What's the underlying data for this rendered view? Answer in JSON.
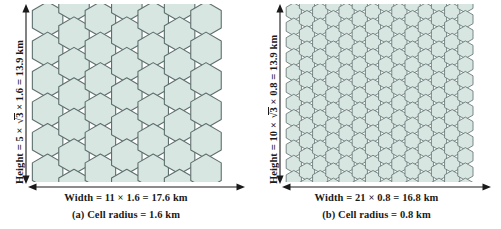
{
  "figure": {
    "background": "#ffffff",
    "cell_fill": "#d8e6e2",
    "cell_stroke": "#5d6f6d",
    "dim_color": "#1a1a1a"
  },
  "panel_a": {
    "height_label": {
      "prefix": "Height = 5 ",
      "times1": "×",
      "radical_body": "3",
      "times2": "×",
      "multiplier": "1.6",
      "equals": "= 13.9 km",
      "full_text": "Height = 5 × √3 × 1.6 = 13.9 km"
    },
    "width_label": "Width = 11 × 1.6 = 17.6 km",
    "subcaption": "(a)  Cell radius = 1.6 km",
    "grid": {
      "hex_radius_px": 17.6,
      "columns": 7,
      "rows_tall": 5,
      "rows_short": 5,
      "orientation": "pointy-top"
    },
    "values": {
      "cell_radius_km": 1.6,
      "height_cells": 5,
      "width_cells": 11,
      "height_km": 13.9,
      "width_km": 17.6
    }
  },
  "panel_b": {
    "height_label": {
      "prefix": "Height = 10 ",
      "times1": "×",
      "radical_body": "3",
      "times2": "×",
      "multiplier": "0.8",
      "equals": "= 13.9 km",
      "full_text": "Height = 10 × √3 × 0.8 = 13.9 km"
    },
    "width_label": "Width = 21 × 0.8 = 16.8 km",
    "subcaption": "(b)  Cell radius = 0.8 km",
    "grid": {
      "hex_radius_px": 8.8,
      "columns": 14,
      "rows_tall": 10,
      "rows_short": 10,
      "orientation": "pointy-top"
    },
    "values": {
      "cell_radius_km": 0.8,
      "height_cells": 10,
      "width_cells": 21,
      "height_km": 13.9,
      "width_km": 16.8
    }
  },
  "chart_data": {
    "type": "diagram",
    "panels": [
      {
        "id": "a",
        "cell_radius_km": 1.6,
        "height_km": 13.9,
        "width_km": 17.6,
        "height_expr": "5 × √3 × 1.6",
        "width_expr": "11 × 1.6",
        "caption": "(a)  Cell radius = 1.6 km"
      },
      {
        "id": "b",
        "cell_radius_km": 0.8,
        "height_km": 13.9,
        "width_km": 16.8,
        "height_expr": "10 × √3 × 0.8",
        "width_expr": "21 × 0.8",
        "caption": "(b)  Cell radius = 0.8 km"
      }
    ]
  }
}
